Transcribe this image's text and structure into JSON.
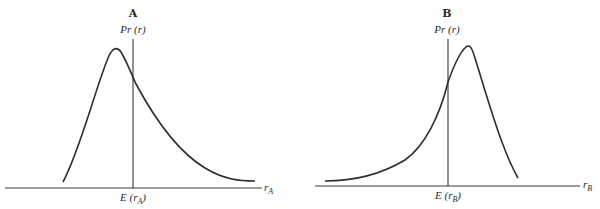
{
  "panels": [
    {
      "title": "A",
      "y_label": "Pr (r)",
      "x_label_main": "r",
      "x_label_sub": "A",
      "mean_label_prefix": "E (r",
      "mean_label_sub": "A",
      "mean_label_suffix": ")",
      "skew": "right"
    },
    {
      "title": "B",
      "y_label": "Pr (r)",
      "x_label_main": "r",
      "x_label_sub": "B",
      "mean_label_prefix": "E (r",
      "mean_label_sub": "B",
      "mean_label_suffix": ")",
      "skew": "left"
    }
  ],
  "colors": {
    "ink": "#2e2e2e",
    "background": "#ffffff"
  }
}
